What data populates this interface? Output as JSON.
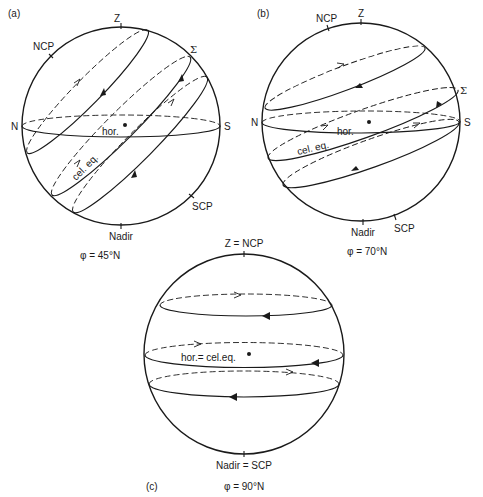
{
  "figure": {
    "panels": [
      {
        "id": "a",
        "panel_label": "(a)",
        "latitude_caption": "φ = 45°N",
        "labels": {
          "zenith": "Z",
          "ncp": "NCP",
          "sigma": "Σ",
          "north": "N",
          "south": "S",
          "scp": "SCP",
          "nadir": "Nadir",
          "horizon": "hor.",
          "celestial_equator": "cel. eq."
        }
      },
      {
        "id": "b",
        "panel_label": "(b)",
        "latitude_caption": "φ = 70°N",
        "labels": {
          "zenith": "Z",
          "ncp": "NCP",
          "sigma": "Σ",
          "north": "N",
          "south": "S",
          "scp": "SCP",
          "nadir": "Nadir",
          "horizon": "hor.",
          "celestial_equator": "cel. eq."
        }
      },
      {
        "id": "c",
        "panel_label": "(c)",
        "latitude_caption": "φ = 90°N",
        "labels": {
          "zenith": "Z = NCP",
          "nadir": "Nadir = SCP",
          "horizon": "hor.= cel.eq."
        }
      }
    ]
  }
}
